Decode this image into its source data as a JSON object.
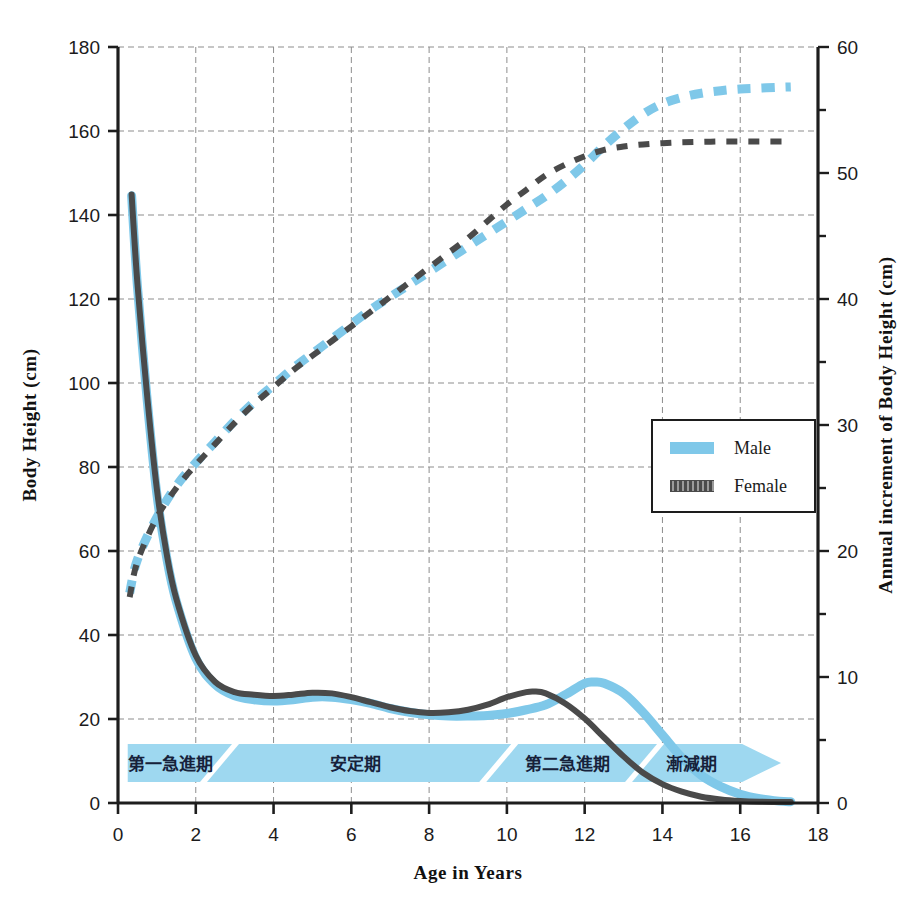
{
  "colors": {
    "male": "#7FC8E9",
    "female": "#4A4A4A",
    "banner": "#9ED8F0",
    "banner_dark": "#8ACDEC",
    "axis": "#1d1d1d",
    "grid": "#8d8d8d",
    "background": "#ffffff"
  },
  "legend": {
    "position": "middle-right",
    "items": [
      {
        "label": "Male",
        "color": "#7FC8E9",
        "style": "solid"
      },
      {
        "label": "Female",
        "color": "#4A4A4A",
        "style": "hatched"
      }
    ]
  },
  "phases": [
    {
      "label": "第一急進期",
      "from": 0.25,
      "to": 2.45
    },
    {
      "label": "安定期",
      "from": 2.6,
      "to": 9.6
    },
    {
      "label": "第二急進期",
      "from": 9.8,
      "to": 13.3
    },
    {
      "label": "漸減期",
      "from": 13.6,
      "to": 15.9
    }
  ],
  "chart_data": {
    "type": "line",
    "title": "",
    "xlabel": "Age in Years",
    "ylabel": "Body Height (cm)",
    "y2label": "Annual increment of Body Height (cm)",
    "xlim": [
      0,
      18
    ],
    "ylim": [
      0,
      180
    ],
    "y2lim": [
      0,
      60
    ],
    "xticks": [
      0,
      2,
      4,
      6,
      8,
      10,
      12,
      14,
      16,
      18
    ],
    "yticks": [
      0,
      20,
      40,
      60,
      80,
      100,
      120,
      140,
      160,
      180
    ],
    "y2ticks": [
      0,
      5,
      10,
      15,
      20,
      25,
      30,
      35,
      40,
      45,
      50,
      55,
      60
    ],
    "grid": true,
    "grid_x_step": 2,
    "grid_y_step": 20,
    "series": [
      {
        "name": "Male height",
        "axis": "left",
        "unit": "cm",
        "style": "dashed",
        "color": "#7FC8E9",
        "x": [
          0.3,
          0.5,
          1,
          1.5,
          2,
          2.5,
          3,
          3.5,
          4,
          4.5,
          5,
          5.5,
          6,
          6.5,
          7,
          7.5,
          8,
          8.5,
          9,
          9.5,
          10,
          10.5,
          11,
          11.5,
          12,
          12.5,
          13,
          13.5,
          14,
          14.5,
          15,
          15.5,
          16,
          16.5,
          17,
          17.3
        ],
        "y": [
          50,
          58,
          68,
          75.5,
          81,
          86,
          91,
          95.5,
          99.5,
          103.5,
          107,
          110.5,
          114,
          117.5,
          120.5,
          123.5,
          126.5,
          129.5,
          132.5,
          135.5,
          138.5,
          141.5,
          144.5,
          148,
          152,
          156.5,
          160.5,
          164,
          166.5,
          168,
          169,
          169.6,
          170,
          170.2,
          170.4,
          170.5
        ]
      },
      {
        "name": "Female height",
        "axis": "left",
        "unit": "cm",
        "style": "dashed",
        "color": "#4A4A4A",
        "x": [
          0.3,
          0.5,
          1,
          1.5,
          2,
          2.5,
          3,
          3.5,
          4,
          4.5,
          5,
          5.5,
          6,
          6.5,
          7,
          7.5,
          8,
          8.5,
          9,
          9.5,
          10,
          10.5,
          11,
          11.5,
          12,
          12.5,
          13,
          13.5,
          14,
          14.5,
          15,
          15.5,
          16,
          16.5,
          17,
          17.3
        ],
        "y": [
          49,
          57.5,
          68,
          75,
          80.5,
          85.5,
          90.5,
          95,
          99,
          103,
          106.5,
          110,
          113.5,
          117,
          120.5,
          124,
          127.5,
          131,
          134.5,
          138.5,
          142.5,
          146,
          149.5,
          152,
          154,
          155.5,
          156.3,
          156.8,
          157.1,
          157.3,
          157.4,
          157.5,
          157.5,
          157.5,
          157.5,
          157.5
        ]
      },
      {
        "name": "Male annual increment",
        "axis": "right",
        "unit": "cm/yr",
        "style": "solid",
        "color": "#7FC8E9",
        "x": [
          0.35,
          0.5,
          0.75,
          1,
          1.25,
          1.5,
          2,
          2.5,
          3,
          3.5,
          4,
          4.5,
          5,
          5.5,
          6,
          6.5,
          7,
          7.5,
          8,
          8.5,
          9,
          9.5,
          10,
          10.5,
          11,
          11.5,
          12,
          12.25,
          12.5,
          13,
          13.5,
          14,
          14.5,
          15,
          15.5,
          16,
          16.5,
          17,
          17.3
        ],
        "y": [
          48.2,
          41,
          32,
          24.5,
          19.5,
          16,
          11.5,
          9.4,
          8.5,
          8.2,
          8.1,
          8.2,
          8.4,
          8.4,
          8.2,
          7.9,
          7.5,
          7.2,
          7.0,
          6.9,
          6.9,
          6.95,
          7.1,
          7.4,
          7.8,
          8.6,
          9.5,
          9.6,
          9.5,
          8.7,
          7.2,
          5.4,
          3.6,
          2.2,
          1.3,
          0.7,
          0.35,
          0.15,
          0.1
        ]
      },
      {
        "name": "Female annual increment",
        "axis": "right",
        "unit": "cm/yr",
        "style": "solid",
        "color": "#4A4A4A",
        "x": [
          0.35,
          0.5,
          0.75,
          1,
          1.25,
          1.5,
          2,
          2.5,
          3,
          3.5,
          4,
          4.5,
          5,
          5.5,
          6,
          6.5,
          7,
          7.5,
          8,
          8.5,
          9,
          9.5,
          10,
          10.5,
          10.7,
          11,
          11.5,
          12,
          12.5,
          13,
          13.5,
          14,
          14.5,
          15,
          15.5,
          16,
          16.5,
          17,
          17.3
        ],
        "y": [
          48.3,
          41.2,
          32.3,
          24.9,
          19.8,
          16.2,
          11.7,
          9.6,
          8.8,
          8.6,
          8.5,
          8.6,
          8.75,
          8.7,
          8.4,
          8.0,
          7.6,
          7.3,
          7.15,
          7.2,
          7.4,
          7.8,
          8.4,
          8.8,
          8.85,
          8.7,
          7.9,
          6.7,
          5.2,
          3.7,
          2.4,
          1.5,
          0.9,
          0.5,
          0.28,
          0.16,
          0.1,
          0.08,
          0.08
        ]
      }
    ],
    "annotations": {
      "male_peak_velocity": {
        "age": 12.25,
        "value": 9.6
      },
      "female_peak_velocity": {
        "age": 10.7,
        "value": 8.85
      },
      "male_final_height": 170.5,
      "female_final_height": 157.5
    }
  }
}
